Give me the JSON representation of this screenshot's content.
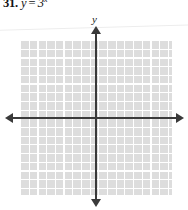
{
  "problem": {
    "number": "31.",
    "equation_text": "y = 3x",
    "equation": {
      "lhs": "y",
      "operator": "=",
      "base": "3",
      "exponent": "x"
    }
  },
  "graph": {
    "y_axis_label": "y",
    "x_axis_label": "",
    "colors": {
      "grid_cell": "#dcdcdc",
      "grid_line": "#ffffff",
      "axis": "#3a3a3a",
      "background": "#ffffff",
      "text": "#141414"
    }
  },
  "chart_data": {
    "type": "line",
    "xlabel": "",
    "ylabel": "y",
    "grid": true,
    "legend": "none",
    "xlim": [
      -8,
      9
    ],
    "ylim": [
      -9,
      9
    ],
    "x_tick_step": 1,
    "y_tick_step": 1,
    "grid_columns": 17,
    "grid_rows": 18,
    "axis_arrows": [
      "left",
      "right",
      "up",
      "down"
    ],
    "series": [
      {
        "name": "y = 3^x",
        "plotted": false,
        "note": "blank grid provided for student to graph the function",
        "x": [],
        "values": []
      }
    ]
  }
}
